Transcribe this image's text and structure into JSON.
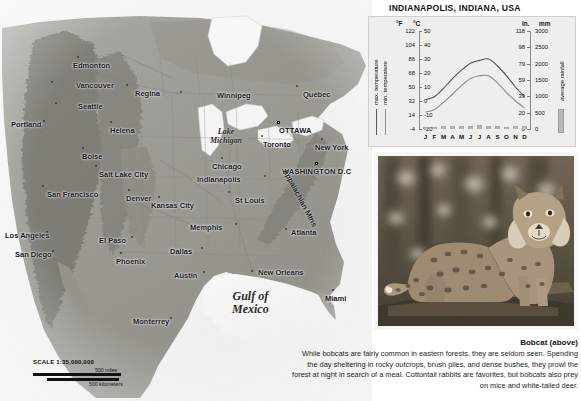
{
  "page": {
    "cutoff_headline": "Temperate Forests of Eastern North America"
  },
  "map": {
    "name": "north-america-relief-map",
    "scale": {
      "title": "SCALE 1:35,000,000",
      "miles_label": "500 miles",
      "km_label": "500 kilometers"
    },
    "cities": [
      {
        "label": "Edmonton",
        "x": 78,
        "y": 57,
        "dx": -5,
        "dy": 9,
        "marker": "dot"
      },
      {
        "label": "Vancouver",
        "x": 52,
        "y": 82,
        "dx": 24,
        "dy": 4,
        "marker": "dot"
      },
      {
        "label": "Regina",
        "x": 127,
        "y": 85,
        "dx": 8,
        "dy": 9,
        "marker": "dot"
      },
      {
        "label": "Winnipeg",
        "x": 181,
        "y": 92,
        "dx": 36,
        "dy": 4,
        "marker": "dot"
      },
      {
        "label": "Québec",
        "x": 297,
        "y": 86,
        "dx": 6,
        "dy": 9,
        "marker": "dot"
      },
      {
        "label": "Seattle",
        "x": 56,
        "y": 103,
        "dx": 22,
        "dy": 4,
        "marker": "dot"
      },
      {
        "label": "Portland",
        "x": 44,
        "y": 121,
        "dx": -33,
        "dy": 4,
        "marker": "dot"
      },
      {
        "label": "Helena",
        "x": 111,
        "y": 122,
        "dx": -1,
        "dy": 9,
        "marker": "dot"
      },
      {
        "label": "OTTAWA",
        "x": 278,
        "y": 122,
        "dx": 1,
        "dy": 9,
        "marker": "sq"
      },
      {
        "label": "Toronto",
        "x": 262,
        "y": 136,
        "dx": 1,
        "dy": 9,
        "marker": "dot"
      },
      {
        "label": "Boise",
        "x": 83,
        "y": 148,
        "dx": -1,
        "dy": 9,
        "marker": "dot"
      },
      {
        "label": "New York",
        "x": 322,
        "y": 139,
        "dx": -7,
        "dy": 9,
        "marker": "dot"
      },
      {
        "label": "Salt Lake City",
        "x": 96,
        "y": 166,
        "dx": 3,
        "dy": 9,
        "marker": "dot"
      },
      {
        "label": "Chicago",
        "x": 222,
        "y": 158,
        "dx": -10,
        "dy": 9,
        "marker": "dot"
      },
      {
        "label": "WASHINGTON D.C",
        "x": 316,
        "y": 163,
        "dx": -34,
        "dy": 9,
        "marker": "sq"
      },
      {
        "label": "San Francisco",
        "x": 43,
        "y": 186,
        "dx": 4,
        "dy": 9,
        "marker": "dot"
      },
      {
        "label": "Denver",
        "x": 129,
        "y": 190,
        "dx": -3,
        "dy": 9,
        "marker": "dot"
      },
      {
        "label": "Indianapolis",
        "x": 265,
        "y": 176,
        "dx": -68,
        "dy": 4,
        "marker": "dot"
      },
      {
        "label": "St Louis",
        "x": 229,
        "y": 192,
        "dx": 6,
        "dy": 9,
        "marker": "dot"
      },
      {
        "label": "Kansas City",
        "x": 159,
        "y": 197,
        "dx": -8,
        "dy": 9,
        "marker": "dot"
      },
      {
        "label": "Memphis",
        "x": 236,
        "y": 224,
        "dx": -46,
        "dy": 4,
        "marker": "dot"
      },
      {
        "label": "Atlanta",
        "x": 286,
        "y": 229,
        "dx": 5,
        "dy": 4,
        "marker": "dot"
      },
      {
        "label": "Los Angeles",
        "x": 47,
        "y": 232,
        "dx": -42,
        "dy": 4,
        "marker": "dot"
      },
      {
        "label": "Dallas",
        "x": 202,
        "y": 248,
        "dx": -32,
        "dy": 4,
        "marker": "dot"
      },
      {
        "label": "Phoenix",
        "x": 121,
        "y": 253,
        "dx": -5,
        "dy": 9,
        "marker": "dot"
      },
      {
        "label": "San Diego",
        "x": 53,
        "y": 251,
        "dx": -38,
        "dy": 4,
        "marker": "dot"
      },
      {
        "label": "El Paso",
        "x": 132,
        "y": 237,
        "dx": -33,
        "dy": 4,
        "marker": "dot"
      },
      {
        "label": "Austin",
        "x": 204,
        "y": 272,
        "dx": -30,
        "dy": 4,
        "marker": "dot"
      },
      {
        "label": "New Orleans",
        "x": 252,
        "y": 271,
        "dx": 6,
        "dy": 2,
        "marker": "dot"
      },
      {
        "label": "Miami",
        "x": 333,
        "y": 290,
        "dx": -8,
        "dy": 9,
        "marker": "dot"
      },
      {
        "label": "Monterrey",
        "x": 171,
        "y": 318,
        "dx": -38,
        "dy": 4,
        "marker": "dot"
      }
    ],
    "water_labels": [
      {
        "label": "Lake\nMichigan",
        "x": 210,
        "y": 128,
        "size": 8
      },
      {
        "label": "Gulf of\nMexico",
        "x": 232,
        "y": 290,
        "size": 12
      }
    ],
    "range_labels": [
      {
        "label": "Appalachian Mtns",
        "x": 285,
        "y": 165,
        "rot": 62
      }
    ]
  },
  "climate": {
    "title": "INDIANAPOLIS, INDIANA, USA",
    "unit_headers": {
      "fahrenheit": "°F",
      "celsius": "°C",
      "inches": "in.",
      "millimeters": "mm"
    },
    "legend": {
      "max_temperature": "max. temperature",
      "min_temperature": "min. temperature",
      "rainfall": "average rainfall"
    }
  },
  "chart_data": {
    "type": "bar",
    "title": "INDIANAPOLIS, INDIANA, USA",
    "categories": [
      "J",
      "F",
      "M",
      "A",
      "M",
      "J",
      "J",
      "A",
      "S",
      "O",
      "N",
      "D"
    ],
    "xlabel": "",
    "grid": false,
    "legend_position": "left-and-right-outside",
    "axes": {
      "left_primary": {
        "label": "°C",
        "ticks": [
          50,
          40,
          30,
          20,
          10,
          0,
          -10,
          -20
        ],
        "range": [
          -20,
          50
        ]
      },
      "left_secondary": {
        "label": "°F",
        "ticks": [
          122,
          104,
          86,
          68,
          50,
          32,
          14,
          -4
        ],
        "range": [
          -4,
          122
        ]
      },
      "right_primary": {
        "label": "mm",
        "ticks": [
          3000,
          2500,
          2000,
          1500,
          1000,
          500,
          0
        ],
        "range": [
          0,
          3000
        ]
      },
      "right_secondary": {
        "label": "in.",
        "ticks": [
          118,
          98,
          79,
          59,
          39,
          20,
          0
        ],
        "range": [
          0,
          118
        ]
      }
    },
    "series": [
      {
        "name": "average rainfall",
        "type": "bar",
        "unit": "mm",
        "axis": "right_primary",
        "values": [
          75,
          75,
          95,
          95,
          105,
          90,
          120,
          95,
          80,
          70,
          80,
          90
        ]
      },
      {
        "name": "max. temperature",
        "type": "line",
        "unit": "°C",
        "axis": "left_primary",
        "values": [
          1,
          3,
          9,
          16,
          22,
          27,
          29,
          30,
          25,
          18,
          10,
          3
        ]
      },
      {
        "name": "min. temperature",
        "type": "line",
        "unit": "°C",
        "axis": "left_primary",
        "values": [
          -8,
          -6,
          -1,
          5,
          11,
          16,
          18,
          18,
          13,
          6,
          0,
          -5
        ]
      }
    ]
  },
  "photo": {
    "name": "bobcat-photograph",
    "alt": "bobcat standing on a log in a forest"
  },
  "caption": {
    "title": "Bobcat (above)",
    "body": "While bobcats are fairly common in eastern forests, they are seldom seen. Spending the day sheltering in rocky outcrops, brush piles, and dense bushes, they prowl the forest at night in search of a meal. Cottontail rabbits are favorites, but bobcats also prey on mice and white-tailed deer."
  },
  "colors": {
    "panel_bg": "#eeeeec",
    "bar_fill": "#b6b6b6",
    "line_stroke": "#4a4a4a",
    "text": "#111111"
  }
}
